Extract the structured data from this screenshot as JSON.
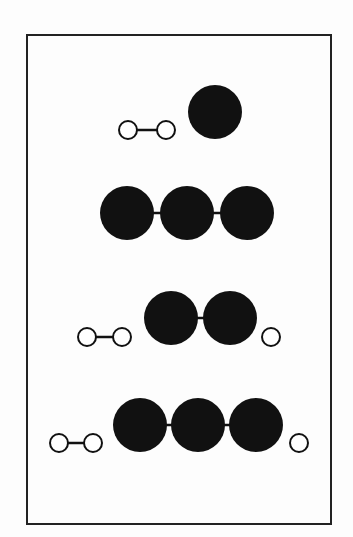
{
  "diagram": {
    "colors": {
      "filled": "#111111",
      "open_fill": "#ffffff",
      "stroke": "#111111",
      "frame": "#222222"
    },
    "frame": {
      "x": 27,
      "y": 35,
      "width": 304,
      "height": 489
    },
    "rows": [
      {
        "name": "row-1",
        "small_atoms": [
          {
            "cx": 128,
            "cy": 130
          },
          {
            "cx": 166,
            "cy": 130
          }
        ],
        "small_bonds": [
          [
            0,
            1
          ]
        ],
        "large_atoms": [
          {
            "cx": 215,
            "cy": 112
          }
        ],
        "large_bonds": []
      },
      {
        "name": "row-2",
        "small_atoms": [],
        "small_bonds": [],
        "large_atoms": [
          {
            "cx": 127,
            "cy": 213
          },
          {
            "cx": 187,
            "cy": 213
          },
          {
            "cx": 247,
            "cy": 213
          }
        ],
        "large_bonds": [
          [
            0,
            1
          ],
          [
            1,
            2
          ]
        ]
      },
      {
        "name": "row-3",
        "small_atoms": [
          {
            "cx": 87,
            "cy": 337
          },
          {
            "cx": 122,
            "cy": 337
          },
          {
            "cx": 271,
            "cy": 337
          }
        ],
        "small_bonds": [
          [
            0,
            1
          ]
        ],
        "large_atoms": [
          {
            "cx": 171,
            "cy": 318
          },
          {
            "cx": 230,
            "cy": 318
          }
        ],
        "large_bonds": [
          [
            0,
            1
          ]
        ]
      },
      {
        "name": "row-4",
        "small_atoms": [
          {
            "cx": 59,
            "cy": 443
          },
          {
            "cx": 93,
            "cy": 443
          },
          {
            "cx": 299,
            "cy": 443
          }
        ],
        "small_bonds": [
          [
            0,
            1
          ]
        ],
        "large_atoms": [
          {
            "cx": 140,
            "cy": 425
          },
          {
            "cx": 198,
            "cy": 425
          },
          {
            "cx": 256,
            "cy": 425
          }
        ],
        "large_bonds": [
          [
            0,
            1
          ],
          [
            1,
            2
          ]
        ]
      }
    ],
    "small_radius": 9,
    "large_radius": 27
  }
}
